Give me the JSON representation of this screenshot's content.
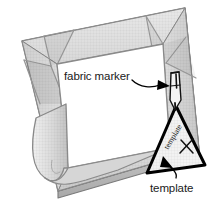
{
  "figure": {
    "style": "grayscale line illustration",
    "background_color": "#ffffff"
  },
  "labels": {
    "fabric_marker": "fabric marker",
    "template": "template"
  },
  "annotations": {
    "template_handwriting": "template",
    "template_mark": "X"
  },
  "icons": {
    "fabric_marker": "pen-icon",
    "template": "triangle-template-icon",
    "callout_marker": "callout-arrow-icon",
    "callout_template": "callout-arrow-icon"
  },
  "colors": {
    "frame_face_light": "#e2e2e2",
    "frame_face_mid": "#d2d2d2",
    "frame_face_dark": "#b9b9b9",
    "frame_side_shadow": "#c9c9c9",
    "outline": "#7a7a7a",
    "outline_dark": "#000000",
    "inner_fabric": "#ffffff",
    "text": "#1a1a1a"
  },
  "geometry": {
    "canvas": {
      "width": 214,
      "height": 201
    },
    "frame_outer": [
      [
        22,
        41
      ],
      [
        185,
        8
      ],
      [
        199,
        150
      ],
      [
        58,
        191
      ]
    ],
    "frame_inner": [
      [
        57,
        64
      ],
      [
        163,
        44
      ],
      [
        170,
        148
      ],
      [
        68,
        168
      ]
    ],
    "template_triangle": [
      [
        176,
        108
      ],
      [
        204,
        164
      ],
      [
        148,
        172
      ]
    ]
  }
}
